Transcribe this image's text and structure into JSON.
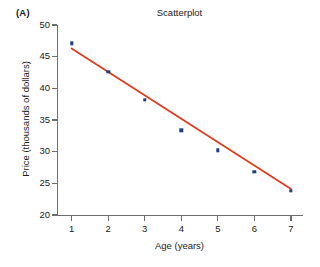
{
  "figure": {
    "panel_label": "(A)",
    "title": "Scatterplot"
  },
  "chart_data": {
    "type": "scatter",
    "title": "Scatterplot",
    "xlabel": "Age (years)",
    "ylabel": "Price (thousands of dollars)",
    "xlim": [
      0.6,
      7.3
    ],
    "ylim": [
      20,
      50
    ],
    "xticks": [
      1,
      2,
      3,
      4,
      5,
      6,
      7
    ],
    "xtick_labels": [
      "1",
      "2",
      "3",
      "4",
      "5",
      "6",
      "7"
    ],
    "yticks": [
      20,
      25,
      30,
      35,
      40,
      45,
      50
    ],
    "ytick_labels": [
      "20",
      "25",
      "30",
      "35",
      "40",
      "45",
      "50"
    ],
    "grid": false,
    "legend": "none",
    "x": [
      1,
      2,
      3,
      4,
      5,
      6,
      7
    ],
    "y": [
      47.1,
      42.6,
      38.2,
      33.4,
      30.2,
      26.8,
      23.8
    ],
    "points": [
      {
        "x": 1,
        "y": 47.1
      },
      {
        "x": 2,
        "y": 42.6
      },
      {
        "x": 3,
        "y": 38.2
      },
      {
        "x": 4,
        "y": 33.4
      },
      {
        "x": 5,
        "y": 30.2
      },
      {
        "x": 6,
        "y": 26.8
      },
      {
        "x": 7,
        "y": 23.8
      }
    ],
    "point_color": "#1f3f82",
    "trendline": {
      "type": "linear-fit",
      "color": "#e03a1e",
      "x_start": 1,
      "y_start": 46.3,
      "x_end": 7,
      "y_end": 24.1,
      "slope": -3.7,
      "intercept": 50.0
    }
  }
}
